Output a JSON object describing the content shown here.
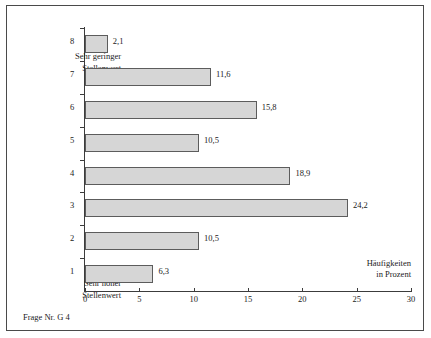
{
  "chart_data": {
    "type": "bar",
    "orientation": "horizontal",
    "title": "",
    "subtitle": "",
    "categories": [
      "1",
      "2",
      "3",
      "4",
      "5",
      "6",
      "7",
      "8"
    ],
    "values": [
      6.3,
      10.5,
      24.2,
      18.9,
      10.5,
      15.8,
      11.6,
      2.1
    ],
    "value_labels": [
      "6,3",
      "10,5",
      "24,2",
      "18,9",
      "10,5",
      "15,8",
      "11,6",
      "2,1"
    ],
    "xlabel": "Häufigkeiten in Prozent",
    "ylabel": "",
    "xlim": [
      0,
      30
    ],
    "xticks": [
      0,
      5,
      10,
      15,
      20,
      25,
      30
    ],
    "xtick_labels": [
      "0",
      "5",
      "10",
      "15",
      "20",
      "25",
      "30"
    ],
    "grid": false,
    "legend": null,
    "bar_color": "#d6d6d6",
    "bar_edge_color": "#5c5c5c",
    "axis_color": "#3c3c3c",
    "annotations": [
      {
        "text": "Sehr geringer Stellenwert",
        "attached_to_category": "8"
      },
      {
        "text": "Sehr hoher Stellenwert",
        "attached_to_category": "1"
      }
    ]
  },
  "axis": {
    "x_title_line1": "Häufigkeiten",
    "x_title_line2": "in Prozent"
  },
  "labels": {
    "anchor_low_line1": "Sehr geringer",
    "anchor_low_line2": "Stellenwert",
    "anchor_high_line1": "Sehr hoher",
    "anchor_high_line2": "Stellenwert"
  },
  "caption": {
    "text": "Frage Nr. G 4"
  }
}
